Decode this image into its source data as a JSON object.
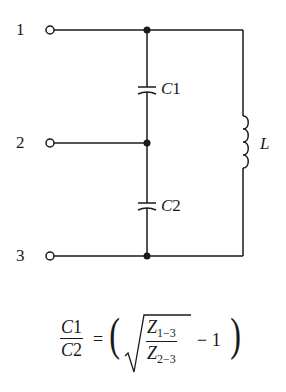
{
  "diagram": {
    "type": "circuit-schematic",
    "title": "",
    "terminals": [
      {
        "id": "1",
        "label": "1"
      },
      {
        "id": "2",
        "label": "2"
      },
      {
        "id": "3",
        "label": "3"
      }
    ],
    "components": [
      {
        "id": "C1",
        "type": "capacitor",
        "label": "C1",
        "between": [
          "1",
          "2"
        ]
      },
      {
        "id": "C2",
        "type": "capacitor",
        "label": "C2",
        "between": [
          "2",
          "3"
        ]
      },
      {
        "id": "L",
        "type": "inductor",
        "label": "L",
        "between": [
          "1",
          "3"
        ]
      }
    ],
    "stroke_color": "#1a1a1a",
    "background": "#ffffff"
  },
  "labels": {
    "t1": "1",
    "t2": "2",
    "t3": "3",
    "c1_italic": "C",
    "c1_num": "1",
    "c2_italic": "C",
    "c2_num": "2",
    "l": "L"
  },
  "formula": {
    "lhs_num_var": "C",
    "lhs_num_idx": "1",
    "lhs_den_var": "C",
    "lhs_den_idx": "2",
    "equals": "=",
    "open_paren": "(",
    "close_paren": ")",
    "z_num_var": "Z",
    "z_num_sub": "1−3",
    "z_den_var": "Z",
    "z_den_sub": "2−3",
    "minus_one": "− 1",
    "text": "C1/C2 = ( sqrt(Z_{1-3}/Z_{2-3}) - 1 )"
  }
}
